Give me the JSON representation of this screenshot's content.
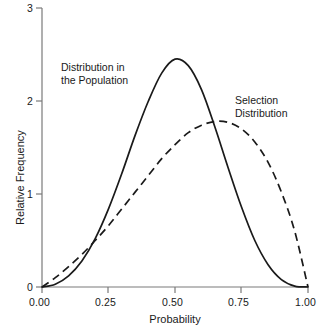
{
  "chart_data": {
    "type": "line",
    "title": "",
    "xlabel": "Probability",
    "ylabel": "Relative Frequency",
    "xlim": [
      0.0,
      1.0
    ],
    "ylim": [
      0.0,
      3.0
    ],
    "xticks": [
      0.0,
      0.25,
      0.5,
      0.75,
      1.0
    ],
    "xtick_labels": [
      "0.00",
      "0.25",
      "0.50",
      "0.75",
      "1.00"
    ],
    "yticks": [
      0,
      1,
      2,
      3
    ],
    "ytick_labels": [
      "0",
      "1",
      "2",
      "3"
    ],
    "grid": false,
    "legend_position": "inline-annotations",
    "series": [
      {
        "name": "Distribution in the Population",
        "style": "solid",
        "color": "#1a1a1a",
        "peak_x": 0.5,
        "peak_y": 2.45,
        "x": [
          0.0,
          0.05,
          0.1,
          0.15,
          0.2,
          0.25,
          0.3,
          0.35,
          0.4,
          0.45,
          0.5,
          0.55,
          0.6,
          0.65,
          0.7,
          0.75,
          0.8,
          0.85,
          0.9,
          0.95,
          1.0
        ],
        "values": [
          0.0,
          0.03,
          0.12,
          0.28,
          0.52,
          0.84,
          1.22,
          1.63,
          2.0,
          2.3,
          2.45,
          2.38,
          2.12,
          1.72,
          1.28,
          0.86,
          0.5,
          0.24,
          0.08,
          0.01,
          0.0
        ]
      },
      {
        "name": "Selection Distribution",
        "style": "dashed",
        "color": "#1a1a1a",
        "peak_x": 0.67,
        "peak_y": 1.78,
        "x": [
          0.0,
          0.05,
          0.1,
          0.15,
          0.2,
          0.25,
          0.3,
          0.35,
          0.4,
          0.45,
          0.5,
          0.55,
          0.6,
          0.65,
          0.7,
          0.75,
          0.8,
          0.85,
          0.9,
          0.95,
          1.0
        ],
        "values": [
          0.0,
          0.1,
          0.22,
          0.35,
          0.5,
          0.66,
          0.84,
          1.02,
          1.2,
          1.38,
          1.53,
          1.66,
          1.74,
          1.78,
          1.77,
          1.7,
          1.56,
          1.34,
          1.02,
          0.6,
          0.0
        ]
      }
    ],
    "annotations": [
      {
        "name": "population-curve-label",
        "lines": [
          "Distribution in",
          "the Population"
        ],
        "x": 0.21,
        "y": 2.45
      },
      {
        "name": "selection-curve-label",
        "lines": [
          "Selection",
          "Distribution"
        ],
        "x": 0.79,
        "y": 2.05
      }
    ]
  }
}
